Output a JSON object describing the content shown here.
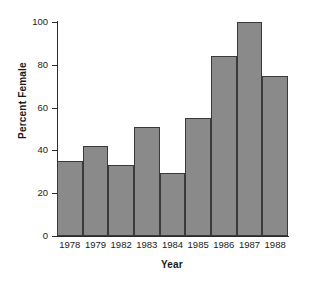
{
  "chart_data": {
    "type": "bar",
    "title": "",
    "xlabel": "Year",
    "ylabel": "Percent Female",
    "categories": [
      "1978",
      "1979",
      "1982",
      "1983",
      "1984",
      "1985",
      "1986",
      "1987",
      "1988"
    ],
    "values": [
      35,
      42,
      33,
      51,
      29.5,
      55,
      84,
      100,
      75
    ],
    "ylim": [
      0,
      100
    ],
    "yticks": [
      "0",
      "20",
      "40",
      "60",
      "80",
      "100"
    ],
    "ytick_values": [
      0,
      20,
      40,
      60,
      80,
      100
    ],
    "grid": false,
    "legend": "none",
    "bar_color": "#8a8a8a",
    "bar_edge_color": "#3a3a3a",
    "axis_color": "#2b2b2b",
    "background_color": "#ffffff"
  }
}
